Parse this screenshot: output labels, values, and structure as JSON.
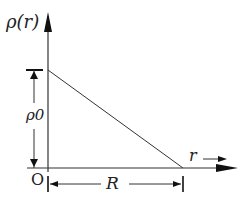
{
  "diagram": {
    "y_axis_label": "ρ(r)",
    "x_axis_label": "r",
    "origin_label": "O",
    "height_label": "ρ0",
    "width_label": "R",
    "line_color": "#222222"
  }
}
